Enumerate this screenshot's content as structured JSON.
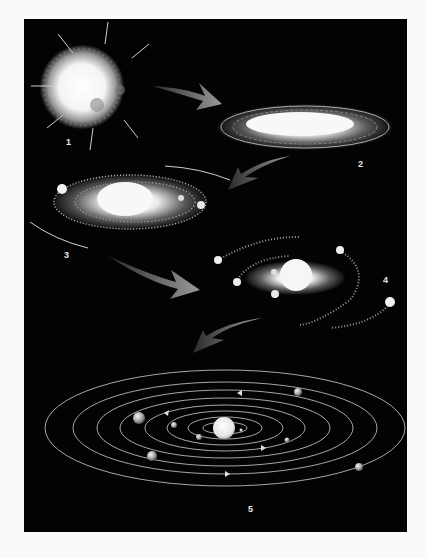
{
  "figure": {
    "title": "",
    "background": "#030303",
    "page_background": "#fafafa",
    "stages": [
      {
        "label": "1",
        "name": "collapsing-nebula"
      },
      {
        "label": "2",
        "name": "flattening-disk"
      },
      {
        "label": "3",
        "name": "spinning-disk-with-condensations"
      },
      {
        "label": "4",
        "name": "protoplanets-forming"
      },
      {
        "label": "5",
        "name": "solar-system-orbits"
      }
    ],
    "arrow_color": "#8a8a8a",
    "orbit_color": "#cfcfcf"
  }
}
